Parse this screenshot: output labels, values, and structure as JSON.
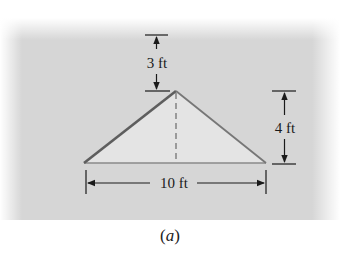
{
  "figure": {
    "caption_open": "(",
    "caption_letter": "a",
    "caption_close": ")",
    "shape": "isosceles-triangle",
    "colors": {
      "background_panel": "#d6d6d6",
      "triangle_fill": "#e4e4e4",
      "triangle_edge": "#6e6e6e",
      "dimension_line": "#1a1a1a"
    },
    "dimensions": {
      "top_gap": {
        "label": "3 ft",
        "value": 3,
        "unit": "ft"
      },
      "height": {
        "label": "4 ft",
        "value": 4,
        "unit": "ft"
      },
      "base": {
        "label": "10 ft",
        "value": 10,
        "unit": "ft"
      }
    }
  }
}
